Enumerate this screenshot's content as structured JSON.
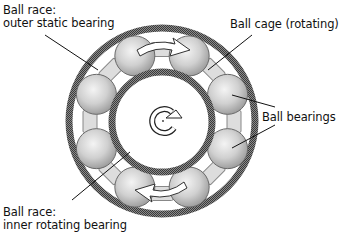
{
  "diagram": {
    "labels": {
      "outer_race": {
        "line1": "Ball race:",
        "line2": "outer static bearing"
      },
      "ball_cage": {
        "text": "Ball cage (rotating)"
      },
      "ball_bearings": {
        "text": "Ball bearings"
      },
      "inner_race": {
        "line1": "Ball race:",
        "line2": "inner rotating bearing"
      }
    },
    "components": {
      "ball_count": 8,
      "cage_count": 8,
      "center_symbol": "rotation-arrow"
    },
    "colors": {
      "ring": "#555555",
      "ball_light": "#f2f2f2",
      "ball_dark": "#9a9a9a",
      "cage": "#dddddd",
      "line": "#111111"
    }
  }
}
